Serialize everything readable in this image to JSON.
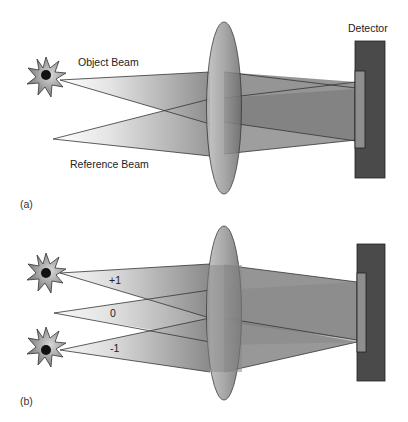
{
  "figure": {
    "panel_a": {
      "label": "(a)",
      "object_beam_label": "Object Beam",
      "reference_beam_label": "Reference Beam",
      "detector_label": "Detector"
    },
    "panel_b": {
      "label": "(b)",
      "order_labels": [
        "+1",
        "0",
        "-1"
      ]
    },
    "colors": {
      "star_fill": "#8a8a8a",
      "star_dot": "#111111",
      "lens_fill": "#8c8c8c",
      "beam_dark": "#7a7a7a",
      "detector_body": "#4a4a4a",
      "detector_sensor": "#8e8e8e",
      "outline": "#333333"
    }
  }
}
